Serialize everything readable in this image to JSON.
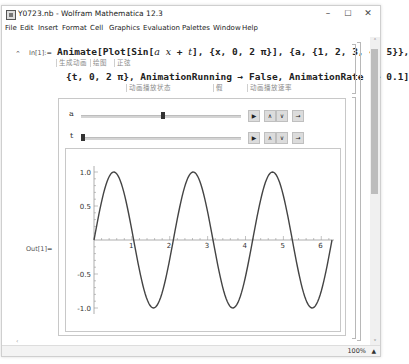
{
  "window": {
    "title": "Y0723.nb - Wolfram Mathematica 12.3",
    "controls": {
      "minimize": "–",
      "maximize": "☐",
      "close": "✕"
    }
  },
  "menu": [
    "File",
    "Edit",
    "Insert",
    "Format",
    "Cell",
    "Graphics",
    "Evaluation",
    "Palettes",
    "Window",
    "Help"
  ],
  "input_cell": {
    "label": "In[1]:=",
    "line1": {
      "fn": "Animate[Plot[Sin[",
      "arg_a": "a",
      "arg_x": "x",
      "mid": " + ",
      "arg_t": "t",
      "rest": "], {x, 0, 2 π}], {a, {1, 2, 3, 4, 5}},"
    },
    "line1_hints": [
      "生成动画",
      "绘图",
      "正弦"
    ],
    "line2": "{t, 0, 2 π}, AnimationRunning → False, AnimationRate -> 0.1]",
    "line2_hints": [
      "动画播放状态",
      "假",
      "动画播放速率"
    ]
  },
  "output_cell": {
    "label": "Out[1]="
  },
  "manipulate": {
    "controls": [
      {
        "name": "a",
        "value": 3,
        "position_fraction": 0.5,
        "buttons": [
          "play",
          "faster",
          "slower",
          "direction"
        ]
      },
      {
        "name": "t",
        "value": 0,
        "position_fraction": 0.0,
        "buttons": [
          "play",
          "faster",
          "slower",
          "direction"
        ]
      }
    ],
    "button_glyphs": {
      "play": "▶",
      "faster": "∧",
      "slower": "∨",
      "direction": "→"
    }
  },
  "status": {
    "zoom": "100%",
    "zoom_arrow": "▲"
  },
  "scroll": {
    "up": "˄",
    "down": "˅",
    "left": "‹"
  },
  "chart_data": {
    "type": "line",
    "title": "",
    "xlabel": "",
    "ylabel": "",
    "function": "Sin[3 x + 0]",
    "a": 3,
    "t": 0,
    "xlim": [
      0,
      6.2832
    ],
    "ylim": [
      -1.0,
      1.0
    ],
    "x_ticks": [
      1,
      2,
      3,
      4,
      5,
      6
    ],
    "x_tick_labels": [
      "1",
      "2",
      "3",
      "4",
      "5",
      "6"
    ],
    "y_ticks": [
      -1.0,
      -0.5,
      0.5,
      1.0
    ],
    "y_tick_labels": [
      "-1.0",
      "-0.5",
      "0.5",
      "1.0"
    ],
    "grid": false,
    "legend": "none",
    "series": [
      {
        "name": "Sin[3x]",
        "color": "#444444",
        "samples": 200
      }
    ]
  }
}
